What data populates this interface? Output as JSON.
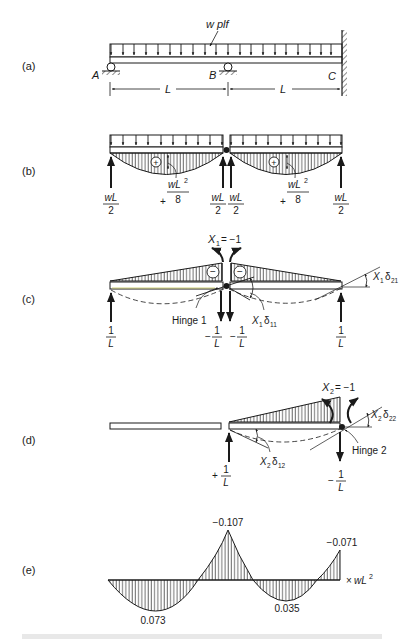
{
  "figure": {
    "panels": {
      "a": {
        "label": "(a)",
        "load_label": "w plf",
        "supports": [
          "A",
          "B",
          "C"
        ],
        "span_labels": [
          "L",
          "L"
        ]
      },
      "b": {
        "label": "(b)",
        "moment_sign": "+",
        "moment_label_sign": "+",
        "moment_num": "wL",
        "moment_exp": "2",
        "moment_den": "8",
        "reaction_num": "wL",
        "reaction_den": "2"
      },
      "c": {
        "label": "(c)",
        "redundant_label": "X",
        "redundant_sub": "1",
        "redundant_value": "= −1",
        "moment_sign": "−",
        "hinge_label": "Hinge 1",
        "delta11_x": "X",
        "delta11_xsub": "1",
        "delta11_d": "δ",
        "delta11_dsub": "11",
        "delta21_x": "X",
        "delta21_xsub": "1",
        "delta21_d": "δ",
        "delta21_dsub": "21",
        "reaction_pos_num": "1",
        "reaction_den": "L",
        "reaction_neg_sign": "−"
      },
      "d": {
        "label": "(d)",
        "redundant_label": "X",
        "redundant_sub": "2",
        "redundant_value": "= −1",
        "hinge_label": "Hinge 2",
        "delta22_x": "X",
        "delta22_xsub": "2",
        "delta22_d": "δ",
        "delta22_dsub": "22",
        "delta12_x": "X",
        "delta12_xsub": "2",
        "delta12_d": "δ",
        "delta12_dsub": "12",
        "reaction_pos_sign": "+",
        "reaction_neg_sign": "−",
        "reaction_num": "1",
        "reaction_den": "L"
      },
      "e": {
        "label": "(e)",
        "values": {
          "span1_max": "0.073",
          "support_b": "−0.107",
          "span2_max": "0.035",
          "support_c": "−0.071"
        },
        "unit_prefix": "×",
        "unit": "wL",
        "unit_exp": "2"
      }
    }
  }
}
